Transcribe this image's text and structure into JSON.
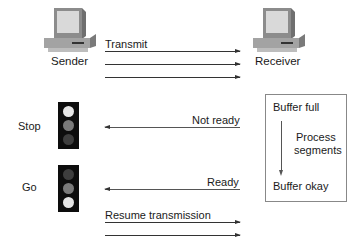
{
  "diagram": {
    "sender": {
      "label": "Sender",
      "icon": "computer-icon"
    },
    "receiver": {
      "label": "Receiver",
      "icon": "computer-icon"
    },
    "transmit": {
      "label": "Transmit",
      "arrow_count": 3,
      "direction": "sender-to-receiver"
    },
    "stop": {
      "label": "Stop",
      "light": {
        "top": "lit",
        "middle": "dim",
        "bottom": "dark"
      }
    },
    "go": {
      "label": "Go",
      "light": {
        "top": "dark",
        "middle": "dim",
        "bottom": "lit"
      }
    },
    "not_ready": {
      "label": "Not ready",
      "direction": "receiver-to-sender"
    },
    "ready": {
      "label": "Ready",
      "direction": "receiver-to-sender"
    },
    "resume": {
      "label": "Resume transmission",
      "arrow_count": 2,
      "direction": "sender-to-receiver"
    },
    "buffer_box": {
      "top_label": "Buffer full",
      "process_label_line1": "Process",
      "process_label_line2": "segments",
      "bottom_label": "Buffer okay"
    },
    "colors": {
      "bulb_lit": "#e6e6e6",
      "bulb_dim": "#7a7a7a",
      "bulb_dark": "#3e3e3e",
      "light_body": "#0d0d0d"
    }
  }
}
